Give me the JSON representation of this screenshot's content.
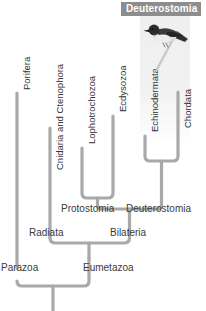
{
  "diagram": {
    "badge": {
      "label": "Deuterostomia",
      "bg": "#8d8d8d",
      "text_color": "#ffffff"
    },
    "line_color": "#a8a8a8",
    "text_color": "#3a3a3a"
  },
  "taxa": [
    {
      "id": "porifera",
      "label": "Porifera",
      "orientation": "vertical"
    },
    {
      "id": "cnidaria",
      "label": "Cnidaria and Ctenophora",
      "orientation": "vertical"
    },
    {
      "id": "lophotroch",
      "label": "Lophotrochozoa",
      "orientation": "vertical"
    },
    {
      "id": "ecdysozoa",
      "label": "Ecdysozoa",
      "orientation": "vertical"
    },
    {
      "id": "echinoderm",
      "label": "Echinodermata",
      "orientation": "vertical"
    },
    {
      "id": "chordata",
      "label": "Chordata",
      "orientation": "vertical"
    }
  ],
  "nodes": [
    {
      "id": "protostomia",
      "label": "Protostomia",
      "orientation": "horizontal"
    },
    {
      "id": "deuterostomia",
      "label": "Deuterostomia",
      "orientation": "horizontal"
    },
    {
      "id": "radiata",
      "label": "Radiata",
      "orientation": "horizontal"
    },
    {
      "id": "bilateria",
      "label": "Bilateria",
      "orientation": "horizontal"
    },
    {
      "id": "parazoa",
      "label": "Parazoa",
      "orientation": "horizontal"
    },
    {
      "id": "eumetazoa",
      "label": "Eumetazoa",
      "orientation": "horizontal"
    }
  ],
  "image": {
    "subject": "perched bird",
    "alt": "bird perched on a branch"
  }
}
